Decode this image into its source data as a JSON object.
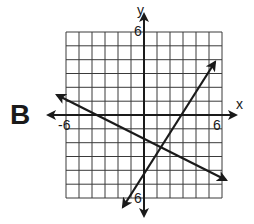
{
  "figure": {
    "panel_label": "B",
    "x_axis_label": "x",
    "y_axis_label": "y",
    "tick_labels": {
      "x_min": "-6",
      "x_max": "6",
      "y_max": "6",
      "y_min": "6"
    },
    "grid": {
      "x_range": [
        -6,
        6
      ],
      "y_range": [
        -6,
        6
      ],
      "cells": 12
    },
    "lines": [
      {
        "name": "decreasing line",
        "direction": "down-right",
        "approx_slope": -0.5,
        "approx_y_intercept": -2
      },
      {
        "name": "increasing line",
        "direction": "up-right",
        "approx_slope": 1.6,
        "approx_y_intercept": -5.5
      }
    ],
    "colors": {
      "ink": "#1a1a1a",
      "grid": "#333333",
      "background": "#ffffff"
    }
  }
}
